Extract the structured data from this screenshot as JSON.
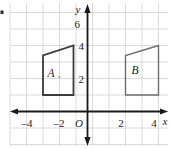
{
  "figure": {
    "background_color": "#ffffff",
    "grid_color": "#cfcfcf",
    "axis_color": "#1a1a1a",
    "shape_a_color": "#3a3a3a",
    "shape_b_color": "#6b6b6b"
  },
  "axes": {
    "x_axis_label": "x",
    "y_axis_label": "y",
    "origin_label": "O",
    "x_ticks": [
      {
        "value": -4,
        "label": "–4"
      },
      {
        "value": -2,
        "label": "–2"
      },
      {
        "value": 2,
        "label": "2"
      },
      {
        "value": 4,
        "label": "4"
      }
    ],
    "y_ticks": [
      {
        "value": 2,
        "label": "2"
      },
      {
        "value": 4,
        "label": "4"
      },
      {
        "value": 6,
        "label": "6"
      }
    ],
    "x_range": [
      -5,
      5
    ],
    "y_range": [
      -2,
      7
    ]
  },
  "shapes": [
    {
      "name": "A",
      "label": "A",
      "vertices": [
        {
          "x": -2.7,
          "y": 1
        },
        {
          "x": -2.7,
          "y": 3.4
        },
        {
          "x": -0.85,
          "y": 4
        },
        {
          "x": -0.85,
          "y": 1
        }
      ]
    },
    {
      "name": "B",
      "label": "B",
      "vertices": [
        {
          "x": 2,
          "y": 1
        },
        {
          "x": 2,
          "y": 3.4
        },
        {
          "x": 4,
          "y": 4
        },
        {
          "x": 4,
          "y": 1
        }
      ]
    }
  ],
  "marks": {
    "interior_dot_a": {
      "x": -1.7,
      "y": 2.2
    },
    "left_edge_mark": {
      "x": 2,
      "y": 12
    }
  }
}
